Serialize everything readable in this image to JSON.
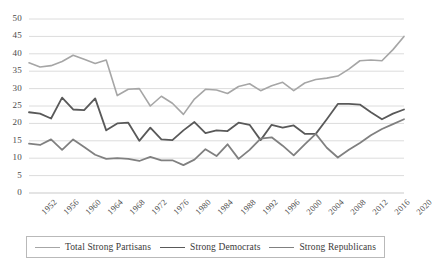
{
  "chart_data": {
    "type": "line",
    "title": "",
    "xlabel": "",
    "ylabel": "",
    "ylim": [
      0,
      50
    ],
    "ytick_step": 5,
    "grid": "horizontal",
    "legend_position": "bottom",
    "x": [
      1952,
      1954,
      1956,
      1958,
      1960,
      1962,
      1964,
      1966,
      1968,
      1970,
      1972,
      1974,
      1976,
      1978,
      1980,
      1982,
      1984,
      1986,
      1988,
      1990,
      1992,
      1994,
      1996,
      1998,
      2000,
      2002,
      2004,
      2006,
      2008,
      2010,
      2012,
      2014,
      2016,
      2018,
      2020
    ],
    "xtick_labels": [
      "1952",
      "1956",
      "1960",
      "1964",
      "1968",
      "1972",
      "1976",
      "1980",
      "1984",
      "1988",
      "1992",
      "1996",
      "2000",
      "2004",
      "2008",
      "2012",
      "2016",
      "2020"
    ],
    "ytick_labels": [
      "0",
      "5",
      "10",
      "15",
      "20",
      "25",
      "30",
      "35",
      "40",
      "45",
      "50"
    ],
    "series": [
      {
        "name": "Total Strong Partisans",
        "color": "#a6a6a6",
        "width": 1.6,
        "values": [
          37.4,
          36.2,
          36.6,
          37.8,
          39.6,
          38.4,
          37.2,
          38.2,
          28.0,
          29.8,
          30.0,
          25.0,
          27.8,
          25.8,
          22.6,
          27.0,
          29.8,
          29.6,
          28.6,
          30.6,
          31.4,
          29.4,
          30.8,
          31.8,
          29.4,
          31.6,
          32.6,
          33.0,
          33.6,
          35.6,
          38.0,
          38.2,
          38.0,
          41.2,
          45.0
        ]
      },
      {
        "name": "Strong Democrats",
        "color": "#595959",
        "width": 1.8,
        "values": [
          23.2,
          22.8,
          21.4,
          27.4,
          24.0,
          23.8,
          27.2,
          18.0,
          20.0,
          20.2,
          15.0,
          18.8,
          15.4,
          15.2,
          18.0,
          20.4,
          17.2,
          18.0,
          17.8,
          20.2,
          19.6,
          15.2,
          19.6,
          18.8,
          19.4,
          17.0,
          17.0,
          21.2,
          25.6,
          25.6,
          25.4,
          23.2,
          21.2,
          22.8,
          24.0
        ]
      },
      {
        "name": "Strong Republicans",
        "color": "#808080",
        "width": 1.8,
        "values": [
          14.2,
          13.8,
          15.4,
          12.4,
          15.4,
          13.2,
          11.0,
          9.8,
          10.0,
          9.8,
          9.2,
          10.4,
          9.4,
          9.4,
          8.0,
          9.6,
          12.6,
          10.6,
          14.0,
          9.8,
          12.4,
          15.6,
          16.0,
          13.6,
          10.8,
          14.0,
          17.0,
          13.0,
          10.2,
          12.4,
          14.4,
          16.6,
          18.4,
          19.8,
          21.2
        ]
      }
    ]
  },
  "legend": {
    "items": [
      {
        "label": "Total Strong Partisans"
      },
      {
        "label": "Strong Democrats"
      },
      {
        "label": "Strong Republicans"
      }
    ]
  }
}
